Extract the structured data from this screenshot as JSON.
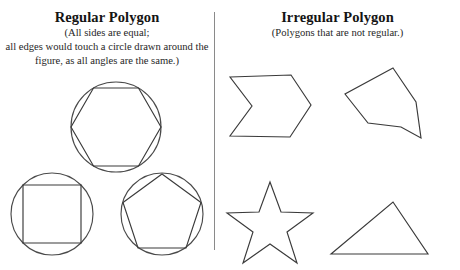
{
  "document": {
    "type": "worksheet",
    "background_color": "#ffffff",
    "stroke_color": "#3a3a3a",
    "divider_color": "#8a8a8a"
  },
  "left_panel": {
    "title": "Regular Polygon",
    "subtitle_lines": [
      "(All sides are equal;",
      "all edges would touch a circle drawn around the",
      "figure, as all angles are the same.)"
    ],
    "shapes": [
      {
        "name": "hexagon-in-circle",
        "label": "Regular hexagon inscribed in a circle",
        "polygon_sides": 6,
        "has_circumscribed_circle": true
      },
      {
        "name": "square-in-circle",
        "label": "Square inscribed in a circle",
        "polygon_sides": 4,
        "has_circumscribed_circle": true
      },
      {
        "name": "pentagon-in-circle",
        "label": "Regular pentagon inscribed in a circle",
        "polygon_sides": 5,
        "has_circumscribed_circle": true
      }
    ]
  },
  "right_panel": {
    "title": "Irregular Polygon",
    "subtitle_lines": [
      "(Polygons that are not regular.)"
    ],
    "shapes": [
      {
        "name": "chevron-arrow",
        "label": "Concave chevron arrow pointing right",
        "polygon_sides": 6,
        "has_circumscribed_circle": false
      },
      {
        "name": "irregular-hexagon",
        "label": "Irregular hexagon",
        "polygon_sides": 6,
        "has_circumscribed_circle": false
      },
      {
        "name": "five-pointed-star",
        "label": "Five pointed star",
        "polygon_sides": 10,
        "has_circumscribed_circle": false
      },
      {
        "name": "scalene-triangle",
        "label": "Scalene triangle",
        "polygon_sides": 3,
        "has_circumscribed_circle": false
      }
    ]
  },
  "footer": {
    "cropped_text": ""
  }
}
